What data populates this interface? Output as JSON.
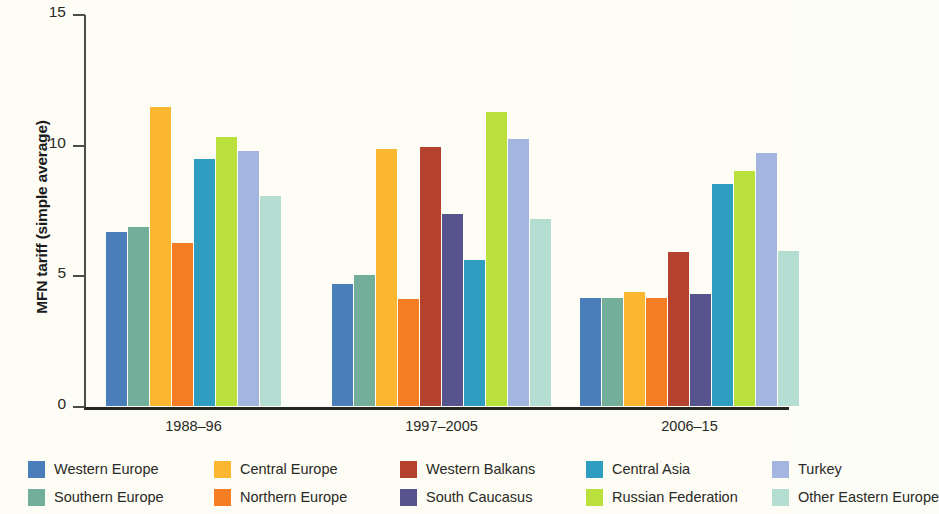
{
  "chart_data": {
    "type": "bar",
    "title": "",
    "subtitle": "",
    "xlabel": "",
    "ylabel": "MFN tariff (simple average)",
    "categories": [
      "1988–96",
      "1997–2005",
      "2006–15"
    ],
    "ylim": [
      0,
      15
    ],
    "yticks": [
      0,
      5,
      10,
      15
    ],
    "ytick_labels": [
      "0",
      "5",
      "10",
      "15"
    ],
    "grid": false,
    "legend_position": "bottom",
    "series": [
      {
        "name": "Western Europe",
        "color": "#4a7ebb",
        "values": [
          6.65,
          4.65,
          4.15
        ]
      },
      {
        "name": "Southern Europe",
        "color": "#73ae9b",
        "values": [
          6.85,
          5.0,
          4.15
        ]
      },
      {
        "name": "Central Europe",
        "color": "#fcb731",
        "values": [
          11.45,
          9.85,
          4.35
        ]
      },
      {
        "name": "Northern Europe",
        "color": "#f57e25",
        "values": [
          6.25,
          4.1,
          4.15
        ]
      },
      {
        "name": "Western Balkans",
        "color": "#b5422f",
        "values": [
          null,
          9.9,
          5.9
        ]
      },
      {
        "name": "South Caucasus",
        "color": "#56538d",
        "values": [
          null,
          7.35,
          4.3
        ]
      },
      {
        "name": "Central Asia",
        "color": "#2e9dc0",
        "values": [
          9.45,
          5.6,
          8.5
        ]
      },
      {
        "name": "Russian Federation",
        "color": "#b9e03c",
        "values": [
          10.3,
          11.25,
          9.0
        ]
      },
      {
        "name": "Turkey",
        "color": "#a3b6e0",
        "values": [
          9.75,
          10.2,
          9.7
        ]
      },
      {
        "name": "Other Eastern Europe",
        "color": "#b5ded3",
        "values": [
          8.05,
          7.15,
          5.95
        ]
      }
    ]
  },
  "legend": {
    "entries": [
      "Western Europe",
      "Central Europe",
      "Western Balkans",
      "Central Asia",
      "Turkey",
      "Southern Europe",
      "Northern Europe",
      "South Caucasus",
      "Russian Federation",
      "Other Eastern Europe"
    ]
  }
}
